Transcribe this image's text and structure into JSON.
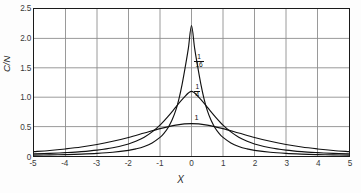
{
  "figure": {
    "background_color": "#fdfdfd",
    "frame_color": "#1a1a1a",
    "grid_color": "#8d8d8d",
    "curve_color": "#111111"
  },
  "chart_data": {
    "type": "line",
    "title": "",
    "xlabel": "X",
    "ylabel": "C/N",
    "xlim": [
      -5,
      5
    ],
    "ylim": [
      0,
      2.5
    ],
    "grid": true,
    "legend_position": "inline-annotations",
    "xticks": [
      "-5",
      "-4",
      "-3",
      "-2",
      "-1",
      "0",
      "1",
      "2",
      "3",
      "4",
      "5"
    ],
    "xtick_values": [
      -5,
      -4,
      -3,
      -2,
      -1,
      0,
      1,
      2,
      3,
      4,
      5
    ],
    "yticks": [
      "0",
      "0.5",
      "1.0",
      "1.5",
      "2.0",
      "2.5"
    ],
    "ytick_values": [
      0,
      0.5,
      1.0,
      1.5,
      2.0,
      2.5
    ],
    "annotations": [
      {
        "label": "1/16",
        "numerator": "1",
        "denominator": "16",
        "x": 0.28,
        "y": 1.62
      },
      {
        "label": "1/4",
        "numerator": "1",
        "denominator": "4",
        "x": 0.28,
        "y": 1.12
      },
      {
        "label": "1",
        "numerator": "1",
        "denominator": "",
        "x": 0.28,
        "y": 0.62
      }
    ],
    "series": [
      {
        "name": "1/16",
        "peak_value": 2.22,
        "peak_x": 0.0,
        "half_width": 0.42,
        "x": [
          -5,
          -4.5,
          -4,
          -3.5,
          -3,
          -2.5,
          -2,
          -1.75,
          -1.5,
          -1.25,
          -1,
          -0.875,
          -0.75,
          -0.625,
          -0.5,
          -0.4,
          -0.3,
          -0.2,
          -0.1,
          0,
          0.1,
          0.2,
          0.3,
          0.4,
          0.5,
          0.625,
          0.75,
          0.875,
          1,
          1.25,
          1.5,
          1.75,
          2,
          2.5,
          3,
          3.5,
          4,
          4.5,
          5
        ],
        "values": [
          0.015,
          0.019,
          0.024,
          0.032,
          0.044,
          0.063,
          0.096,
          0.123,
          0.163,
          0.223,
          0.316,
          0.385,
          0.477,
          0.602,
          0.775,
          0.968,
          1.215,
          1.51,
          1.83,
          2.22,
          1.83,
          1.51,
          1.215,
          0.968,
          0.775,
          0.602,
          0.477,
          0.385,
          0.316,
          0.223,
          0.163,
          0.123,
          0.096,
          0.063,
          0.044,
          0.032,
          0.024,
          0.019,
          0.015
        ]
      },
      {
        "name": "1/4",
        "peak_value": 1.1,
        "peak_x": 0.0,
        "half_width": 0.82,
        "x": [
          -5,
          -4.5,
          -4,
          -3.5,
          -3,
          -2.5,
          -2,
          -1.75,
          -1.5,
          -1.25,
          -1,
          -0.75,
          -0.5,
          -0.25,
          0,
          0.25,
          0.5,
          0.75,
          1,
          1.25,
          1.5,
          1.75,
          2,
          2.5,
          3,
          3.5,
          4,
          4.5,
          5
        ],
        "values": [
          0.035,
          0.044,
          0.057,
          0.074,
          0.1,
          0.14,
          0.205,
          0.255,
          0.32,
          0.41,
          0.525,
          0.67,
          0.83,
          0.99,
          1.1,
          0.99,
          0.83,
          0.67,
          0.525,
          0.41,
          0.32,
          0.255,
          0.205,
          0.14,
          0.1,
          0.074,
          0.057,
          0.044,
          0.035
        ]
      },
      {
        "name": "1",
        "peak_value": 0.55,
        "peak_x": 0.0,
        "half_width": 1.65,
        "x": [
          -5,
          -4.5,
          -4,
          -3.5,
          -3,
          -2.5,
          -2,
          -1.5,
          -1,
          -0.5,
          0,
          0.5,
          1,
          1.5,
          2,
          2.5,
          3,
          3.5,
          4,
          4.5,
          5
        ],
        "values": [
          0.075,
          0.094,
          0.12,
          0.152,
          0.195,
          0.25,
          0.315,
          0.39,
          0.465,
          0.525,
          0.55,
          0.525,
          0.465,
          0.39,
          0.315,
          0.25,
          0.195,
          0.152,
          0.12,
          0.094,
          0.075
        ]
      }
    ]
  }
}
